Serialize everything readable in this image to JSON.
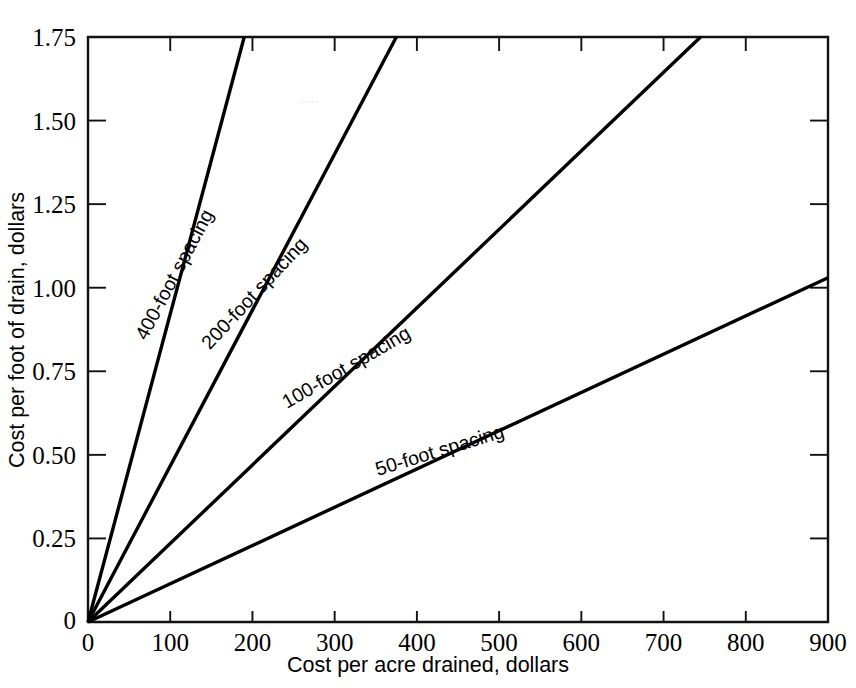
{
  "chart_data": {
    "type": "line",
    "title": "",
    "xlabel": "Cost per acre drained, dollars",
    "ylabel": "Cost per foot of drain, dollars",
    "xlim": [
      0,
      900
    ],
    "ylim": [
      0,
      1.75
    ],
    "grid": false,
    "legend_position": "inline-labels",
    "x_ticks": [
      0,
      100,
      200,
      300,
      400,
      500,
      600,
      700,
      800,
      900
    ],
    "x_ticklabels": [
      "0",
      "100",
      "200",
      "300",
      "400",
      "500",
      "600",
      "700",
      "800",
      "900"
    ],
    "y_ticks": [
      0,
      0.25,
      0.5,
      0.75,
      1.0,
      1.25,
      1.5,
      1.75
    ],
    "y_ticklabels": [
      "0",
      "0.25",
      "0.50",
      "0.75",
      "1.00",
      "1.25",
      "1.50",
      "1.75"
    ],
    "x_tick_interval": 100,
    "y_tick_interval": 0.25,
    "series": [
      {
        "name": "400-foot spacing",
        "label": "400-foot spacing",
        "slope_per_dollar": 0.00921,
        "x": [
          0,
          190
        ],
        "values": [
          0,
          1.75
        ],
        "label_anchor": {
          "x": 112,
          "y": 1.03
        },
        "label_rotation_deg": -62
      },
      {
        "name": "200-foot spacing",
        "label": "200-foot spacing",
        "slope_per_dollar": 0.004667,
        "x": [
          0,
          375
        ],
        "values": [
          0,
          1.75
        ],
        "label_anchor": {
          "x": 208,
          "y": 0.97
        },
        "label_rotation_deg": -47
      },
      {
        "name": "100-foot spacing",
        "label": "100-foot spacing",
        "slope_per_dollar": 0.002349,
        "x": [
          0,
          745
        ],
        "values": [
          0,
          1.75
        ],
        "label_anchor": {
          "x": 318,
          "y": 0.745
        },
        "label_rotation_deg": -30
      },
      {
        "name": "50-foot spacing",
        "label": "50-foot spacing",
        "slope_per_dollar": 0.001144,
        "x": [
          0,
          900
        ],
        "values": [
          0,
          1.03
        ],
        "label_anchor": {
          "x": 430,
          "y": 0.495
        },
        "label_rotation_deg": -17
      }
    ]
  },
  "axes": {
    "x_axis_title": "Cost per acre drained, dollars",
    "y_axis_title": "Cost per foot of drain, dollars",
    "origin_label": "0"
  },
  "artifacts": {
    "watermark_text": "·····"
  }
}
